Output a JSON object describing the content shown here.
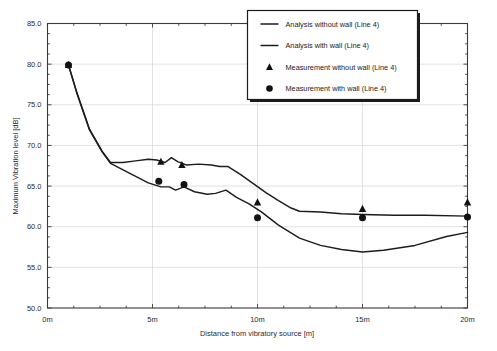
{
  "chart_data": {
    "type": "line",
    "title": "",
    "xlabel": "Distance from vibratory source [m]",
    "ylabel": "Maximum Vibration level [dB]",
    "xlim": [
      0,
      20
    ],
    "ylim": [
      50.0,
      85.0
    ],
    "grid": true,
    "legend_position": "top-right",
    "x_tick_labels": [
      "0m",
      "5m",
      "10m",
      "15m",
      "20m"
    ],
    "x_tick_values": [
      0,
      5,
      10,
      15,
      20
    ],
    "y_tick_labels": [
      "50.0",
      "55.0",
      "60.0",
      "65.0",
      "70.0",
      "75.0",
      "80.0",
      "85.0"
    ],
    "y_tick_values": [
      50.0,
      55.0,
      60.0,
      65.0,
      70.0,
      75.0,
      80.0,
      85.0
    ],
    "series": [
      {
        "name": "Analysis without wall (Line 4)",
        "style": "line",
        "x": [
          1.0,
          1.4,
          2.0,
          2.6,
          3.0,
          3.6,
          4.2,
          4.8,
          5.2,
          5.6,
          5.9,
          6.2,
          6.6,
          7.2,
          7.8,
          8.2,
          8.6,
          9.2,
          9.8,
          10.4,
          11.0,
          11.6,
          12.0,
          13.0,
          14.0,
          15.0,
          16.5,
          18.0,
          20.0
        ],
        "y": [
          79.9,
          76.5,
          72.0,
          69.3,
          67.9,
          67.9,
          68.1,
          68.3,
          68.2,
          67.9,
          68.5,
          68.0,
          67.6,
          67.7,
          67.6,
          67.4,
          67.4,
          66.4,
          65.3,
          64.2,
          63.2,
          62.3,
          61.9,
          61.8,
          61.6,
          61.5,
          61.4,
          61.4,
          61.3
        ]
      },
      {
        "name": "Analysis with wall (Line 4)",
        "style": "line",
        "x": [
          1.0,
          1.4,
          2.0,
          2.6,
          3.0,
          3.6,
          4.2,
          4.8,
          5.4,
          5.8,
          6.1,
          6.5,
          7.0,
          7.6,
          8.0,
          8.5,
          9.0,
          9.6,
          10.2,
          11.0,
          12.0,
          13.0,
          14.0,
          15.0,
          16.0,
          17.5,
          19.0,
          20.0
        ],
        "y": [
          79.9,
          76.4,
          71.9,
          69.2,
          67.8,
          67.0,
          66.2,
          65.4,
          64.9,
          64.9,
          64.5,
          64.9,
          64.3,
          64.0,
          64.1,
          64.5,
          63.6,
          62.8,
          61.8,
          60.2,
          58.6,
          57.7,
          57.2,
          56.9,
          57.1,
          57.7,
          58.8,
          59.3
        ]
      },
      {
        "name": "Measurement without wall (Line 4)",
        "style": "triangle",
        "x": [
          1.0,
          5.4,
          6.4,
          10.0,
          15.0,
          20.0
        ],
        "y": [
          79.9,
          68.0,
          67.6,
          63.0,
          62.2,
          63.0
        ]
      },
      {
        "name": "Measurement with wall (Line 4)",
        "style": "circle",
        "x": [
          1.0,
          5.3,
          6.5,
          10.0,
          15.0,
          20.0
        ],
        "y": [
          79.9,
          65.6,
          65.2,
          61.1,
          61.1,
          61.2
        ]
      }
    ]
  },
  "legend": {
    "items": [
      {
        "label": "Analysis without wall (Line 4)",
        "marker": "line"
      },
      {
        "label": "Analysis with wall (Line 4)",
        "marker": "line"
      },
      {
        "label": "Measurement without wall (Line 4)",
        "marker": "triangle"
      },
      {
        "label": "Measurement with wall (Line 4)",
        "marker": "circle"
      }
    ]
  },
  "axes": {
    "x_title": "Distance from vibratory source [m]",
    "y_title": "Maximum Vibration level [dB]",
    "x_ticks": [
      "0m",
      "5m",
      "10m",
      "15m",
      "20m"
    ],
    "y_ticks": [
      "85.0",
      "80.0",
      "75.0",
      "70.0",
      "65.0",
      "60.0",
      "55.0",
      "50.0"
    ]
  },
  "caption": {
    "text": ""
  },
  "colors": {
    "line": "#1c1c1c",
    "grid": "#cfcfcf",
    "frame": "#3a3a3a",
    "background": "#ffffff"
  }
}
